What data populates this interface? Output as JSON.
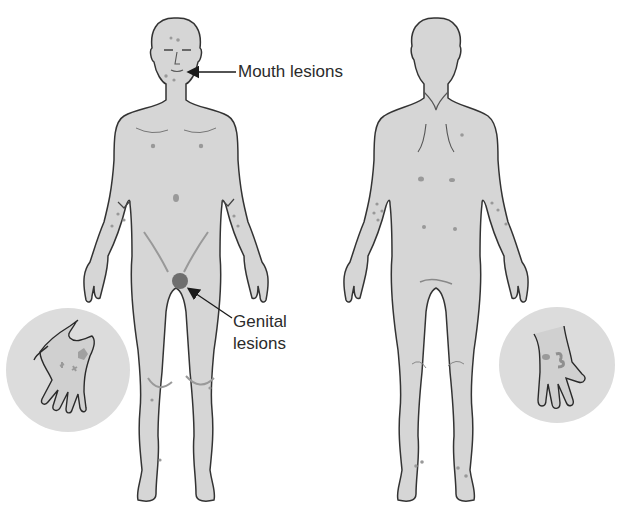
{
  "figure": {
    "views": [
      "anterior-view",
      "posterior-view"
    ],
    "labels": {
      "mouth": "Mouth lesions",
      "genital_line1": "Genital",
      "genital_line2": "lesions"
    },
    "insets": [
      "palm-inset-left",
      "palm-inset-right"
    ],
    "colors": {
      "skin": "#d6d6d6",
      "outline": "#3a3a3a",
      "lesion": "#9a9a9a",
      "genital_lesion": "#6e6e6e",
      "inset_bg": "#dcdcdc",
      "text": "#2b2b2b"
    }
  }
}
